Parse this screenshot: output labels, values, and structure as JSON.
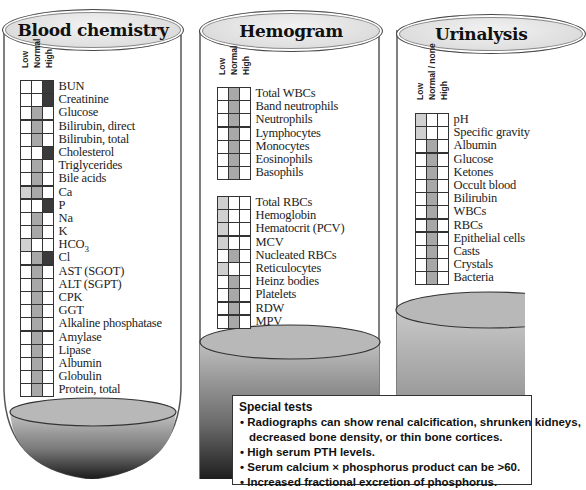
{
  "legend_shades": {
    "light": "#d0d0d0",
    "mid": "#a8a8a8",
    "dark": "#3a3a3a"
  },
  "blood_chemistry": {
    "title": "Blood chemistry",
    "columns": [
      "Low",
      "Normal",
      "High"
    ],
    "rows": [
      {
        "label": "BUN",
        "cells": [
          "",
          "",
          "dark"
        ]
      },
      {
        "label": "Creatinine",
        "cells": [
          "",
          "",
          "dark"
        ]
      },
      {
        "label": "Glucose",
        "cells": [
          "",
          "mid",
          ""
        ]
      },
      {
        "label": "Bilirubin, direct",
        "cells": [
          "",
          "mid",
          ""
        ]
      },
      {
        "label": "Bilirubin, total",
        "cells": [
          "",
          "mid",
          ""
        ]
      },
      {
        "label": "Cholesterol",
        "cells": [
          "",
          "",
          "dark"
        ]
      },
      {
        "label": "Triglycerides",
        "cells": [
          "",
          "mid",
          ""
        ]
      },
      {
        "label": "Bile acids",
        "cells": [
          "",
          "mid",
          ""
        ]
      },
      {
        "label": "Ca",
        "cells": [
          "light",
          "mid",
          ""
        ]
      },
      {
        "label": "P",
        "cells": [
          "",
          "",
          "dark"
        ]
      },
      {
        "label": "Na",
        "cells": [
          "",
          "mid",
          ""
        ]
      },
      {
        "label": "K",
        "cells": [
          "",
          "mid",
          ""
        ]
      },
      {
        "label": "HCO3",
        "cells": [
          "light",
          "",
          ""
        ]
      },
      {
        "label": "Cl",
        "cells": [
          "",
          "mid",
          "dark"
        ]
      },
      {
        "label": "AST (SGOT)",
        "cells": [
          "",
          "mid",
          ""
        ]
      },
      {
        "label": "ALT (SGPT)",
        "cells": [
          "",
          "mid",
          ""
        ]
      },
      {
        "label": "CPK",
        "cells": [
          "",
          "mid",
          ""
        ]
      },
      {
        "label": "GGT",
        "cells": [
          "",
          "mid",
          ""
        ]
      },
      {
        "label": "Alkaline phosphatase",
        "cells": [
          "",
          "mid",
          ""
        ]
      },
      {
        "label": "Amylase",
        "cells": [
          "",
          "mid",
          ""
        ]
      },
      {
        "label": "Lipase",
        "cells": [
          "",
          "mid",
          ""
        ]
      },
      {
        "label": "Albumin",
        "cells": [
          "",
          "mid",
          ""
        ]
      },
      {
        "label": "Globulin",
        "cells": [
          "",
          "mid",
          ""
        ]
      },
      {
        "label": "Protein, total",
        "cells": [
          "",
          "mid",
          ""
        ]
      }
    ]
  },
  "hemogram": {
    "title": "Hemogram",
    "columns": [
      "Low",
      "Normal",
      "High"
    ],
    "wbc_rows": [
      {
        "label": "Total WBCs",
        "cells": [
          "",
          "mid",
          ""
        ]
      },
      {
        "label": "Band neutrophils",
        "cells": [
          "",
          "mid",
          ""
        ]
      },
      {
        "label": "Neutrophils",
        "cells": [
          "",
          "mid",
          ""
        ]
      },
      {
        "label": "Lymphocytes",
        "cells": [
          "",
          "mid",
          ""
        ]
      },
      {
        "label": "Monocytes",
        "cells": [
          "",
          "mid",
          ""
        ]
      },
      {
        "label": "Eosinophils",
        "cells": [
          "",
          "mid",
          ""
        ]
      },
      {
        "label": "Basophils",
        "cells": [
          "",
          "mid",
          ""
        ]
      }
    ],
    "rbc_rows": [
      {
        "label": "Total RBCs",
        "cells": [
          "light",
          "",
          ""
        ]
      },
      {
        "label": "Hemoglobin",
        "cells": [
          "light",
          "",
          ""
        ]
      },
      {
        "label": "Hematocrit (PCV)",
        "cells": [
          "light",
          "",
          ""
        ]
      },
      {
        "label": "MCV",
        "cells": [
          "light",
          "",
          ""
        ]
      },
      {
        "label": "Nucleated RBCs",
        "cells": [
          "",
          "mid",
          ""
        ]
      },
      {
        "label": "Reticulocytes",
        "cells": [
          "light",
          "",
          ""
        ]
      },
      {
        "label": "Heinz bodies",
        "cells": [
          "",
          "mid",
          ""
        ]
      },
      {
        "label": "Platelets",
        "cells": [
          "",
          "mid",
          ""
        ]
      },
      {
        "label": "RDW",
        "cells": [
          "",
          "mid",
          ""
        ]
      },
      {
        "label": "MPV",
        "cells": [
          "",
          "mid",
          ""
        ]
      }
    ]
  },
  "urinalysis": {
    "title": "Urinalysis",
    "columns": [
      "Low",
      "Normal / none",
      "High"
    ],
    "rows": [
      {
        "label": "pH",
        "cells": [
          "light",
          "",
          ""
        ]
      },
      {
        "label": "Specific gravity",
        "cells": [
          "light",
          "",
          ""
        ]
      },
      {
        "label": "Albumin",
        "cells": [
          "",
          "mid",
          ""
        ]
      },
      {
        "label": "Glucose",
        "cells": [
          "",
          "mid",
          ""
        ]
      },
      {
        "label": "Ketones",
        "cells": [
          "",
          "mid",
          ""
        ]
      },
      {
        "label": "Occult blood",
        "cells": [
          "",
          "mid",
          ""
        ]
      },
      {
        "label": "Bilirubin",
        "cells": [
          "",
          "mid",
          ""
        ]
      },
      {
        "label": "WBCs",
        "cells": [
          "",
          "mid",
          ""
        ]
      },
      {
        "label": "RBCs",
        "cells": [
          "",
          "mid",
          ""
        ]
      },
      {
        "label": "Epithelial cells",
        "cells": [
          "",
          "mid",
          ""
        ]
      },
      {
        "label": "Casts",
        "cells": [
          "",
          "mid",
          ""
        ]
      },
      {
        "label": "Crystals",
        "cells": [
          "",
          "mid",
          ""
        ]
      },
      {
        "label": "Bacteria",
        "cells": [
          "",
          "mid",
          ""
        ]
      }
    ]
  },
  "special_tests": {
    "title": "Special tests",
    "items": [
      "Radiographs can show renal calcification, shrunken kidneys,",
      "decreased bone density, or thin bone cortices.",
      "High serum PTH levels.",
      "Serum calcium × phosphorus product can be >60.",
      "Increased fractional excretion of phosphorus."
    ]
  }
}
